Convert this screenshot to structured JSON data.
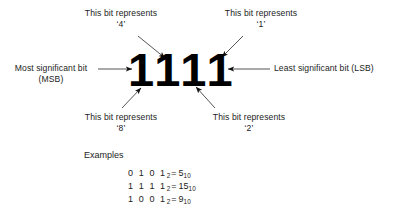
{
  "diagram": {
    "bits": [
      {
        "value": "1",
        "weight": "8",
        "position": "msb"
      },
      {
        "value": "1",
        "weight": "4",
        "position": "bit2"
      },
      {
        "value": "1",
        "weight": "2",
        "position": "bit1"
      },
      {
        "value": "1",
        "weight": "1",
        "position": "lsb"
      }
    ],
    "binary_word": "1111",
    "callouts": {
      "top_left": {
        "line1": "This bit represents",
        "line2": "‘4’"
      },
      "top_right": {
        "line1": "This bit represents",
        "line2": "‘1’"
      },
      "bottom_left": {
        "line1": "This bit represents",
        "line2": "‘8’"
      },
      "bottom_right": {
        "line1": "This bit represents",
        "line2": "‘2’"
      },
      "left": {
        "line1": "Most significant bit",
        "line2": "(MSB)"
      },
      "right": {
        "line1": "Least significant bit (LSB)"
      }
    },
    "examples": {
      "heading": "Examples",
      "rows": [
        {
          "binary": "0 1 0 1",
          "binary_sub": "2",
          "equals": "=",
          "decimal": "5",
          "decimal_sub": "10"
        },
        {
          "binary": "1 1 1 1",
          "binary_sub": "2",
          "equals": "=",
          "decimal": "15",
          "decimal_sub": "10"
        },
        {
          "binary": "1 0 0 1",
          "binary_sub": "2",
          "equals": "=",
          "decimal": "9",
          "decimal_sub": "10"
        }
      ]
    },
    "colors": {
      "background": "#ffffff",
      "text": "#1c1c1c",
      "digits": "#000000",
      "leader": "#555555"
    }
  }
}
